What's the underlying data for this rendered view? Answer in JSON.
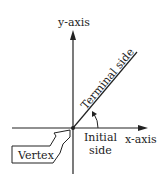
{
  "diagram": {
    "labels": {
      "y_axis": "y-axis",
      "x_axis": "x-axis",
      "terminal_side": "Terminal side",
      "initial_side_line1": "Initial",
      "initial_side_line2": "side",
      "vertex": "Vertex"
    },
    "colors": {
      "stroke": "#222222",
      "background": "#ffffff"
    }
  }
}
